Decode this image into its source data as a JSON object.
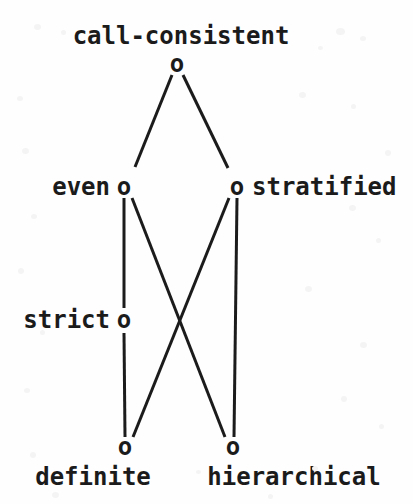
{
  "figure": {
    "kind": "hasse-lattice-diagram",
    "width": 413,
    "height": 504,
    "background_color": "#fefefe",
    "ink_color": "#1b1b1b",
    "node_glyph": "o"
  },
  "nodes": [
    {
      "id": "call-consistent",
      "label": "call-consistent",
      "glyph": "o",
      "x": 177,
      "y": 64,
      "label_x": 181,
      "label_y": 36,
      "label_placement": "above"
    },
    {
      "id": "even",
      "label": "even",
      "glyph": "o",
      "x": 124,
      "y": 187,
      "label_x": 110,
      "label_y": 187,
      "label_placement": "left"
    },
    {
      "id": "stratified",
      "label": "stratified",
      "glyph": "o",
      "x": 237,
      "y": 187,
      "label_x": 252,
      "label_y": 187,
      "label_placement": "right"
    },
    {
      "id": "strict",
      "label": "strict",
      "glyph": "o",
      "x": 124,
      "y": 320,
      "label_x": 110,
      "label_y": 320,
      "label_placement": "left"
    },
    {
      "id": "definite",
      "label": "definite",
      "glyph": "o",
      "x": 125,
      "y": 447,
      "label_x": 93,
      "label_y": 477,
      "label_placement": "below"
    },
    {
      "id": "hierarchical",
      "label": "hierarchical",
      "glyph": "o",
      "x": 233,
      "y": 447,
      "label_x": 294,
      "label_y": 477,
      "label_placement": "below"
    }
  ],
  "edges": [
    {
      "id": "even--call-consistent",
      "from": "even",
      "to": "call-consistent",
      "x1": 135,
      "y1": 167,
      "x2": 172,
      "y2": 75
    },
    {
      "id": "stratified--call-consistent",
      "from": "stratified",
      "to": "call-consistent",
      "x1": 228,
      "y1": 168,
      "x2": 183,
      "y2": 75
    },
    {
      "id": "strict--even",
      "from": "strict",
      "to": "even",
      "x1": 124,
      "y1": 308,
      "x2": 124,
      "y2": 198
    },
    {
      "id": "definite--strict",
      "from": "definite",
      "to": "strict",
      "x1": 125,
      "y1": 437,
      "x2": 124,
      "y2": 333
    },
    {
      "id": "hierarchical--stratified",
      "from": "hierarchical",
      "to": "stratified",
      "x1": 234,
      "y1": 437,
      "x2": 237,
      "y2": 198
    },
    {
      "id": "hierarchical--even",
      "from": "hierarchical",
      "to": "even",
      "x1": 225,
      "y1": 437,
      "x2": 132,
      "y2": 198
    },
    {
      "id": "definite--stratified",
      "from": "definite",
      "to": "stratified",
      "x1": 133,
      "y1": 437,
      "x2": 229,
      "y2": 198
    }
  ],
  "style": {
    "edge_width": 3,
    "edge_color": "#1b1b1b",
    "font_size_px": 24
  }
}
